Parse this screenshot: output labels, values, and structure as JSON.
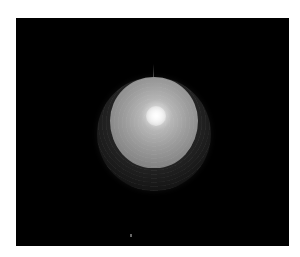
{
  "scene": {
    "description": "Rendered shaded sphere on black background",
    "background_color": "#000000",
    "frame_color": "#ffffff",
    "sphere": {
      "lit_color": "#b0b0b0",
      "highlight_color": "#ffffff",
      "shadow_color": "#1a1a1a"
    }
  }
}
